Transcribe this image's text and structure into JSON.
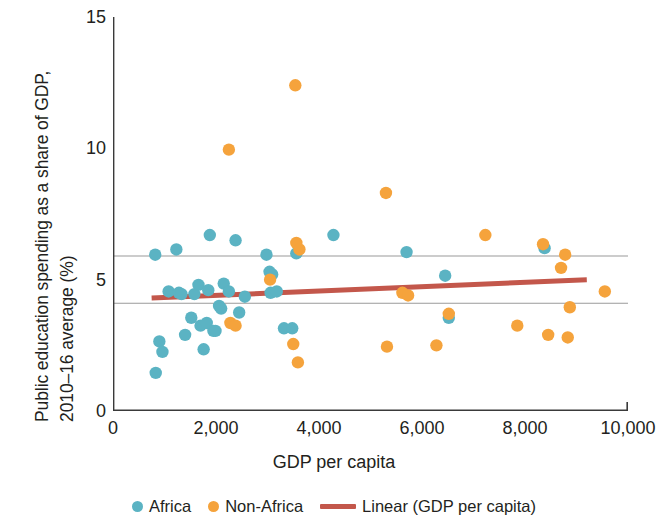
{
  "chart_data": {
    "type": "scatter",
    "title": "",
    "xlabel": "GDP per capita",
    "ylabel": "Public education spending as a share of GDP, 2010–16 average (%)",
    "ylabel_line1": "Public education spending as a share of GDP,",
    "ylabel_line2": "2010–16 average (%)",
    "xlim": [
      0,
      10000
    ],
    "ylim": [
      0,
      15
    ],
    "xticks": [
      0,
      2000,
      4000,
      6000,
      8000,
      10000
    ],
    "xtick_labels": [
      "0",
      "2,000",
      "4,000",
      "6,000",
      "8,000",
      "10,000"
    ],
    "yticks": [
      0,
      5,
      10,
      15
    ],
    "ytick_labels": [
      "0",
      "5",
      "10",
      "15"
    ],
    "grid": "horizontal-band",
    "gridlines_y": [
      4.1,
      5.9
    ],
    "legend_position": "bottom-center",
    "colors": {
      "africa": "#5BB3C3",
      "non_africa": "#F5A33C",
      "trend": "#C3574B",
      "gridline": "#9a9a9a",
      "axis": "#3a3a3a",
      "text": "#231f20",
      "background": "#ffffff"
    },
    "series": [
      {
        "name": "Africa",
        "color": "#5BB3C3",
        "marker": "circle",
        "points": [
          [
            820,
            5.95
          ],
          [
            830,
            1.45
          ],
          [
            900,
            2.65
          ],
          [
            960,
            2.25
          ],
          [
            1080,
            4.55
          ],
          [
            1230,
            6.15
          ],
          [
            1280,
            4.5
          ],
          [
            1330,
            4.45
          ],
          [
            1400,
            2.9
          ],
          [
            1520,
            3.55
          ],
          [
            1580,
            4.45
          ],
          [
            1660,
            4.8
          ],
          [
            1700,
            3.25
          ],
          [
            1760,
            2.35
          ],
          [
            1820,
            3.35
          ],
          [
            1850,
            4.6
          ],
          [
            1880,
            6.7
          ],
          [
            1950,
            3.05
          ],
          [
            1990,
            3.05
          ],
          [
            2060,
            4.0
          ],
          [
            2100,
            3.9
          ],
          [
            2150,
            4.85
          ],
          [
            2250,
            4.55
          ],
          [
            2380,
            6.5
          ],
          [
            2450,
            3.75
          ],
          [
            2560,
            4.35
          ],
          [
            2980,
            5.95
          ],
          [
            3040,
            5.3
          ],
          [
            3060,
            4.5
          ],
          [
            3090,
            5.2
          ],
          [
            3180,
            4.55
          ],
          [
            3320,
            3.15
          ],
          [
            3480,
            3.15
          ],
          [
            3560,
            6.0
          ],
          [
            4280,
            6.7
          ],
          [
            5700,
            6.05
          ],
          [
            6450,
            5.15
          ],
          [
            6520,
            3.55
          ],
          [
            8380,
            6.2
          ]
        ]
      },
      {
        "name": "Non-Africa",
        "color": "#F5A33C",
        "marker": "circle",
        "points": [
          [
            2250,
            9.95
          ],
          [
            2280,
            3.35
          ],
          [
            2380,
            3.25
          ],
          [
            3050,
            5.0
          ],
          [
            3500,
            2.55
          ],
          [
            3540,
            12.4
          ],
          [
            3560,
            6.4
          ],
          [
            3590,
            1.85
          ],
          [
            3620,
            6.15
          ],
          [
            5300,
            8.3
          ],
          [
            5320,
            2.45
          ],
          [
            5620,
            4.5
          ],
          [
            5730,
            4.4
          ],
          [
            6280,
            2.5
          ],
          [
            6520,
            3.7
          ],
          [
            7230,
            6.7
          ],
          [
            7850,
            3.25
          ],
          [
            8350,
            6.35
          ],
          [
            8450,
            2.9
          ],
          [
            8700,
            5.45
          ],
          [
            8780,
            5.95
          ],
          [
            8830,
            2.8
          ],
          [
            8870,
            3.95
          ],
          [
            9550,
            4.55
          ]
        ]
      }
    ],
    "trendline": {
      "name": "Linear (GDP per capita)",
      "color": "#C3574B",
      "x_start": 750,
      "y_start": 4.3,
      "x_end": 9200,
      "y_end": 5.0
    },
    "legend": [
      {
        "label": "Africa",
        "type": "dot",
        "color": "#5BB3C3"
      },
      {
        "label": "Non-Africa",
        "type": "dot",
        "color": "#F5A33C"
      },
      {
        "label": "Linear (GDP per capita)",
        "type": "line",
        "color": "#C3574B"
      }
    ]
  }
}
